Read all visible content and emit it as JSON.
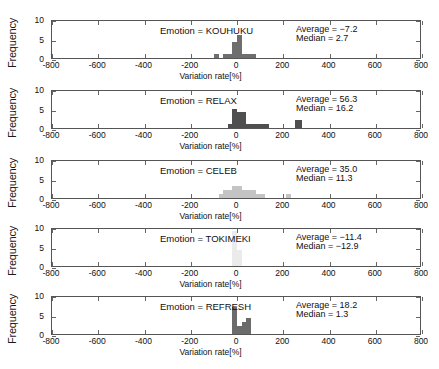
{
  "figure": {
    "xlabel": "Variation rate[%]",
    "ylabel": "Frequency",
    "caption": ""
  },
  "axis": {
    "xticks": [
      "-800",
      "-600",
      "-400",
      "-200",
      "0",
      "200",
      "400",
      "600",
      "800"
    ],
    "yticks": [
      "0",
      "5",
      "10"
    ]
  },
  "chart_data": {
    "type": "bar",
    "title": "",
    "xlabel": "Variation rate[%]",
    "ylabel": "Frequency",
    "xlim": [
      -800,
      800
    ],
    "ylim": [
      0,
      10
    ],
    "xticks": [
      -800,
      -600,
      -400,
      -200,
      0,
      200,
      400,
      600,
      800
    ],
    "yticks": [
      0,
      5,
      10
    ],
    "grid": false,
    "legend": null,
    "bin_width": 20,
    "panels": [
      {
        "name": "KOUHUKU",
        "label": "Emotion = KOUHUKU",
        "average": "Average = −7.2",
        "median": "Median = 2.7",
        "average_value": -7.2,
        "median_value": 2.7,
        "bar_color": "#6e6e6e",
        "bins": [
          {
            "x0": -100,
            "x1": -80,
            "count": 1
          },
          {
            "x0": -60,
            "x1": -40,
            "count": 1
          },
          {
            "x0": -40,
            "x1": -20,
            "count": 1
          },
          {
            "x0": -20,
            "x1": 0,
            "count": 4
          },
          {
            "x0": 0,
            "x1": 20,
            "count": 6
          },
          {
            "x0": 20,
            "x1": 40,
            "count": 1
          },
          {
            "x0": 40,
            "x1": 60,
            "count": 1
          },
          {
            "x0": 60,
            "x1": 80,
            "count": 1
          }
        ]
      },
      {
        "name": "RELAX",
        "label": "Emotion = RELAX",
        "average": "Average = 56.3",
        "median": "Median = 16.2",
        "average_value": 56.3,
        "median_value": 16.2,
        "bar_color": "#4f4f4f",
        "bins": [
          {
            "x0": -40,
            "x1": -20,
            "count": 1
          },
          {
            "x0": -20,
            "x1": 0,
            "count": 5
          },
          {
            "x0": 0,
            "x1": 20,
            "count": 4
          },
          {
            "x0": 20,
            "x1": 40,
            "count": 4
          },
          {
            "x0": 40,
            "x1": 60,
            "count": 1
          },
          {
            "x0": 60,
            "x1": 80,
            "count": 1
          },
          {
            "x0": 80,
            "x1": 100,
            "count": 1
          },
          {
            "x0": 100,
            "x1": 120,
            "count": 1
          },
          {
            "x0": 120,
            "x1": 140,
            "count": 1
          },
          {
            "x0": 250,
            "x1": 280,
            "count": 2
          }
        ]
      },
      {
        "name": "CELEB",
        "label": "Emotion = CELEB",
        "average": "Average = 35.0",
        "median": "Median = 11.3",
        "average_value": 35.0,
        "median_value": 11.3,
        "bar_color": "#c4c4c4",
        "bins": [
          {
            "x0": -80,
            "x1": -60,
            "count": 1
          },
          {
            "x0": -60,
            "x1": -40,
            "count": 2
          },
          {
            "x0": -40,
            "x1": -20,
            "count": 2
          },
          {
            "x0": -20,
            "x1": 0,
            "count": 3
          },
          {
            "x0": 0,
            "x1": 20,
            "count": 3
          },
          {
            "x0": 20,
            "x1": 40,
            "count": 2
          },
          {
            "x0": 40,
            "x1": 60,
            "count": 2
          },
          {
            "x0": 60,
            "x1": 80,
            "count": 2
          },
          {
            "x0": 80,
            "x1": 100,
            "count": 1
          },
          {
            "x0": 100,
            "x1": 120,
            "count": 1
          },
          {
            "x0": 210,
            "x1": 235,
            "count": 1
          }
        ]
      },
      {
        "name": "TOKIMEKI",
        "label": "Emotion = TOKIMEKI",
        "average": "Average = −11.4",
        "median": "Median = −12.9",
        "average_value": -11.4,
        "median_value": -12.9,
        "bar_color": "#ebebeb",
        "bins": [
          {
            "x0": -20,
            "x1": 0,
            "count": 9
          },
          {
            "x0": 0,
            "x1": 20,
            "count": 4
          }
        ]
      },
      {
        "name": "REFRESH",
        "label": "Emotion = REFRESH",
        "average": "Average = 18.2",
        "median": "Median = 1.3",
        "average_value": 18.2,
        "median_value": 1.3,
        "bar_color": "#6b6b6b",
        "bins": [
          {
            "x0": -20,
            "x1": 0,
            "count": 7
          },
          {
            "x0": 0,
            "x1": 20,
            "count": 2
          },
          {
            "x0": 20,
            "x1": 40,
            "count": 3
          },
          {
            "x0": 40,
            "x1": 60,
            "count": 4
          }
        ]
      }
    ]
  }
}
